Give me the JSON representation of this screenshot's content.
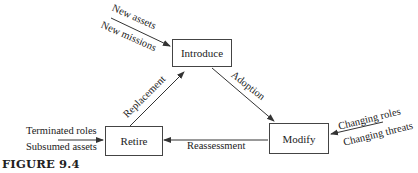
{
  "figure": {
    "caption": "FIGURE 9.4"
  },
  "nodes": {
    "introduce": "Introduce",
    "modify": "Modify",
    "retire": "Retire"
  },
  "edges": {
    "adoption": "Adoption",
    "reassessment": "Reassessment",
    "replacement": "Replacement"
  },
  "inputs": {
    "introduce": [
      "New assets",
      "New missions"
    ],
    "modify": [
      "Changing roles",
      "Changing threats"
    ],
    "retire": [
      "Terminated roles",
      "Subsumed assets"
    ]
  },
  "colors": {
    "line": "#333333",
    "text": "#222222"
  }
}
